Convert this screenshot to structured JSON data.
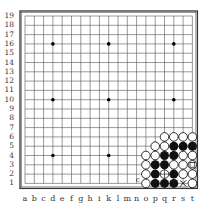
{
  "board": {
    "size": 19,
    "columns": [
      "a",
      "b",
      "c",
      "d",
      "e",
      "f",
      "g",
      "h",
      "i",
      "k",
      "l",
      "m",
      "n",
      "o",
      "p",
      "q",
      "r",
      "s",
      "t"
    ],
    "rows": [
      19,
      18,
      17,
      16,
      15,
      14,
      13,
      12,
      11,
      10,
      9,
      8,
      7,
      6,
      5,
      4,
      3,
      2,
      1
    ],
    "star_points": [
      "d16",
      "k16",
      "r16",
      "d10",
      "k10",
      "r10",
      "d4",
      "k4",
      "r4"
    ],
    "white_stones": [
      "q6",
      "r6",
      "s6",
      "t6",
      "p5",
      "q5",
      "o4",
      "p4",
      "s4",
      "t4",
      "o3",
      "r3",
      "s3",
      "t3",
      "o2",
      "s2",
      "t2",
      "o1",
      "t1"
    ],
    "black_stones": [
      "r5",
      "s5",
      "t5",
      "q4",
      "r4",
      "p3",
      "q3",
      "p2",
      "r2",
      "p1",
      "q1",
      "r1"
    ],
    "marks": [
      {
        "point": "t3",
        "type": "square"
      },
      {
        "point": "q2",
        "type": "circle-cross"
      },
      {
        "point": "s1",
        "type": "x"
      },
      {
        "point": "n1",
        "type": "letter",
        "text": "c"
      }
    ],
    "colors": {
      "line": "#555555",
      "black": "#111111",
      "white": "#ffffff",
      "border": "#333333"
    }
  }
}
